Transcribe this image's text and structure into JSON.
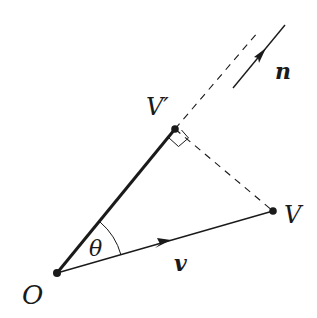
{
  "diagram": {
    "type": "vector-projection",
    "colors": {
      "stroke": "#1a1a1a",
      "background": "#ffffff"
    },
    "points": {
      "O": {
        "label": "O",
        "x": 57,
        "y": 273
      },
      "V_prime": {
        "label": "V′",
        "x": 175,
        "y": 129
      },
      "V": {
        "label": "V",
        "x": 273,
        "y": 211
      }
    },
    "labels": {
      "origin": "O",
      "projection_point": "V′",
      "point": "V",
      "angle": "θ",
      "vector_v": "v",
      "normal_n": "n"
    },
    "annotations": {
      "right_angle_at": "V′",
      "dashed_lines": [
        "V′ to V (perpendicular)",
        "extension of OV′ beyond V′"
      ],
      "thick_segment": "O to V′"
    }
  }
}
